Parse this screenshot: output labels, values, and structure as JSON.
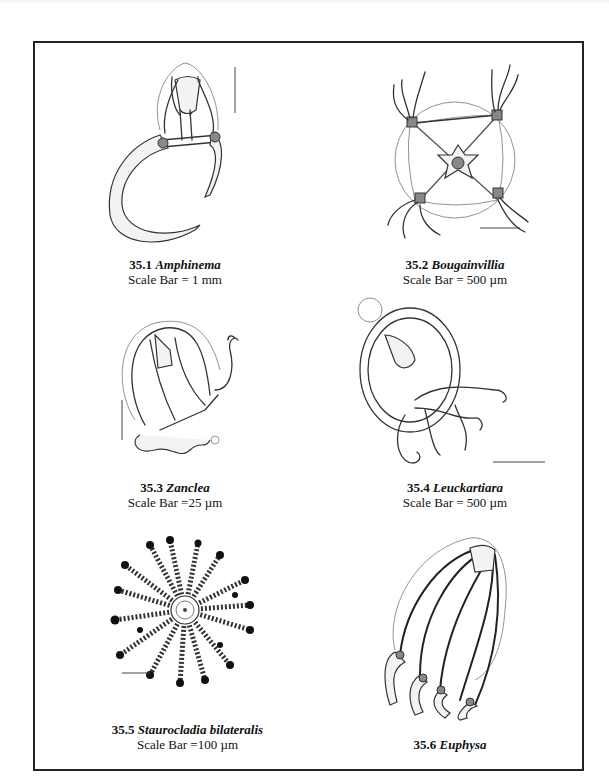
{
  "figure": {
    "plates": [
      {
        "number": "35.1",
        "genus": "Amphinema",
        "scale": "Scale Bar = 1 mm"
      },
      {
        "number": "35.2",
        "genus": "Bougainvillia",
        "scale": "Scale Bar = 500 µm"
      },
      {
        "number": "35.3",
        "genus": "Zanclea",
        "scale": "Scale Bar =25 µm"
      },
      {
        "number": "35.4",
        "genus": "Leuckartiara",
        "scale": "Scale Bar = 500 µm"
      },
      {
        "number": "35.5",
        "genus": "Staurocladia bilateralis",
        "scale": "Scale Bar =100 µm"
      },
      {
        "number": "35.6",
        "genus": "Euphysa",
        "scale": ""
      }
    ]
  }
}
